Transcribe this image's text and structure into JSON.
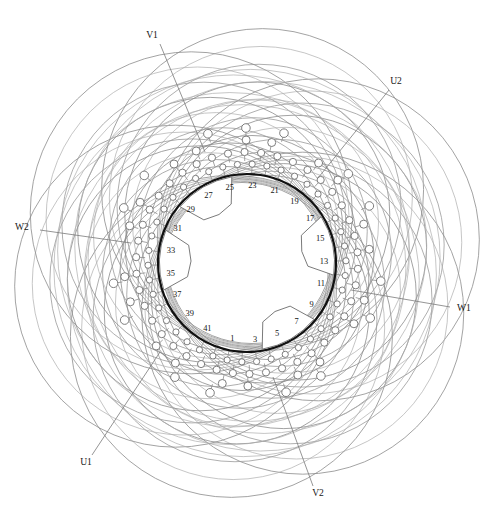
{
  "diagram": {
    "type": "motor-winding-schematic",
    "slot_count": 42,
    "bore": {
      "cx": 247,
      "cy": 263,
      "r": 89
    },
    "colors": {
      "bore_stroke": "#111111",
      "endturn_stroke": "#8c8c8c",
      "node_stroke": "#6f6f6f",
      "node_fill": "#ffffff",
      "text": "#141414",
      "background": "#ffffff"
    }
  },
  "slot_numbers": [
    {
      "label": "1",
      "angle": 191
    },
    {
      "label": "3",
      "angle": 174
    },
    {
      "label": "5",
      "angle": 157
    },
    {
      "label": "7",
      "angle": 140
    },
    {
      "label": "9",
      "angle": 123
    },
    {
      "label": "11",
      "angle": 106
    },
    {
      "label": "13",
      "angle": 89
    },
    {
      "label": "15",
      "angle": 72
    },
    {
      "label": "17",
      "angle": 55
    },
    {
      "label": "19",
      "angle": 38
    },
    {
      "label": "21",
      "angle": 21
    },
    {
      "label": "23",
      "angle": 4
    },
    {
      "label": "25",
      "angle": 347
    },
    {
      "label": "27",
      "angle": 330
    },
    {
      "label": "29",
      "angle": 313
    },
    {
      "label": "31",
      "angle": 296
    },
    {
      "label": "33",
      "angle": 279
    },
    {
      "label": "35",
      "angle": 262
    },
    {
      "label": "37",
      "angle": 245
    },
    {
      "label": "39",
      "angle": 228
    },
    {
      "label": "41",
      "angle": 211
    }
  ],
  "terminals": [
    {
      "name": "V1",
      "label": "V1",
      "x": 152,
      "y": 36,
      "line": [
        [
          160,
          44
        ],
        [
          205,
          152
        ]
      ]
    },
    {
      "name": "U2",
      "label": "U2",
      "x": 396,
      "y": 82,
      "line": [
        [
          389,
          90
        ],
        [
          318,
          178
        ]
      ]
    },
    {
      "name": "W2",
      "label": "W2",
      "x": 22,
      "y": 228,
      "line": [
        [
          40,
          230
        ],
        [
          131,
          243
        ]
      ]
    },
    {
      "name": "W1",
      "label": "W1",
      "x": 464,
      "y": 309,
      "line": [
        [
          450,
          307
        ],
        [
          351,
          290
        ]
      ]
    },
    {
      "name": "U1",
      "label": "U1",
      "x": 86,
      "y": 463,
      "line": [
        [
          92,
          455
        ],
        [
          160,
          352
        ]
      ]
    },
    {
      "name": "V2",
      "label": "V2",
      "x": 318,
      "y": 494,
      "line": [
        [
          313,
          486
        ],
        [
          273,
          377
        ]
      ]
    }
  ],
  "pole_shoes": [
    {
      "name": "pole-shoe-top",
      "center_angle": 330,
      "span": 40
    },
    {
      "name": "pole-shoe-right",
      "center_angle": 78,
      "span": 40
    },
    {
      "name": "pole-shoe-bottom",
      "center_angle": 150,
      "span": 40
    },
    {
      "name": "pole-shoe-left",
      "center_angle": 272,
      "span": 40
    }
  ],
  "legend": {
    "phase_u": "U",
    "phase_v": "V",
    "phase_w": "W",
    "start_suffix": "1",
    "end_suffix": "2"
  },
  "chart_data": {
    "type": "diagram",
    "slots": [
      1,
      3,
      5,
      7,
      9,
      11,
      13,
      15,
      17,
      19,
      21,
      23,
      25,
      27,
      29,
      31,
      33,
      35,
      37,
      39,
      41
    ],
    "terminals": [
      "U1",
      "U2",
      "V1",
      "V2",
      "W1",
      "W2"
    ],
    "phases": 3,
    "pole_shoe_count": 4
  }
}
